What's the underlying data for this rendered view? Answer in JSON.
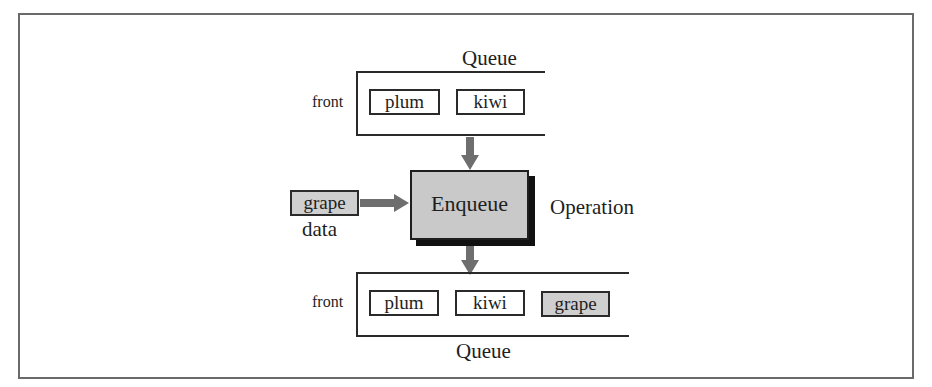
{
  "diagram": {
    "top_queue": {
      "label": "Queue",
      "front_label": "front",
      "items": [
        "plum",
        "kiwi"
      ]
    },
    "operation": {
      "name": "Enqueue",
      "label": "Operation"
    },
    "input": {
      "value": "grape",
      "label": "data"
    },
    "bottom_queue": {
      "label": "Queue",
      "front_label": "front",
      "items": [
        "plum",
        "kiwi",
        "grape"
      ],
      "highlighted_item": "grape"
    },
    "colors": {
      "box_fill_gray": "#c9c9c9",
      "arrow": "#6e6e6e",
      "outline": "#2a2a2a",
      "frame": "#6a6a6a"
    }
  }
}
